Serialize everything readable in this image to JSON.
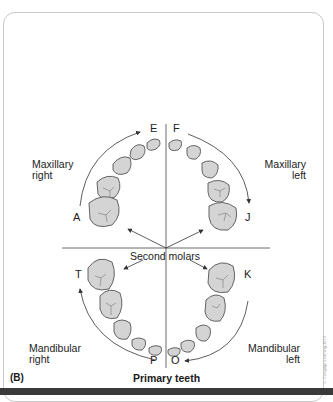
{
  "figure": {
    "panel_label": "(B)",
    "caption": "Primary teeth",
    "center_label": "Second molars",
    "credit_text": "© Cengage Learning 2013"
  },
  "quadrants": {
    "maxillary_right": {
      "line1": "Maxillary",
      "line2": "right"
    },
    "maxillary_left": {
      "line1": "Maxillary",
      "line2": "left"
    },
    "mandibular_right": {
      "line1": "Mandibular",
      "line2": "right"
    },
    "mandibular_left": {
      "line1": "Mandibular",
      "line2": "left"
    }
  },
  "tooth_letters": {
    "A": "A",
    "E": "E",
    "F": "F",
    "J": "J",
    "K": "K",
    "O": "O",
    "P": "P",
    "T": "T"
  },
  "colors": {
    "tooth_fill": "#d4d4d4",
    "tooth_stroke": "#555555",
    "line": "#333333"
  }
}
